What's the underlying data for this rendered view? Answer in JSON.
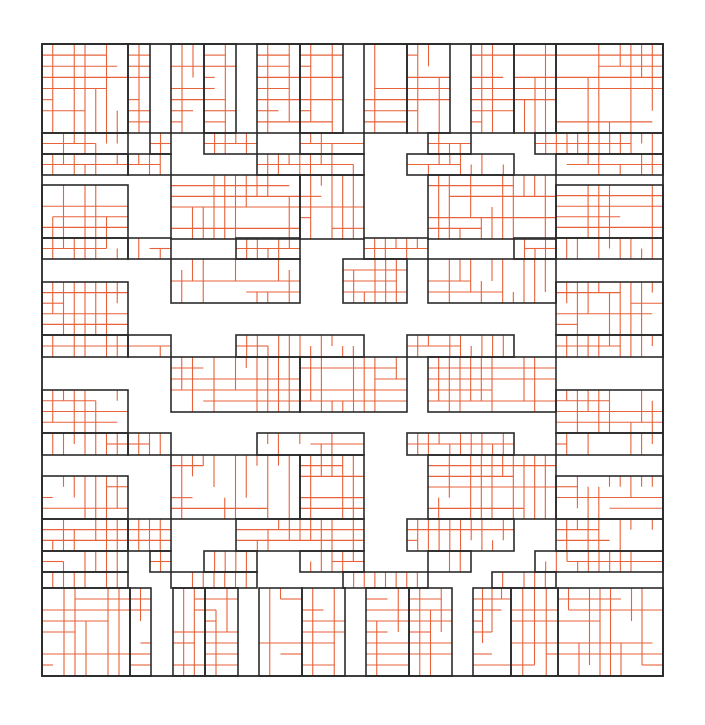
{
  "diagram": {
    "title": "",
    "colors": {
      "black_line": "#2b2b2b",
      "orange_line": "#e8623a",
      "background": "#ffffff"
    },
    "outer_square": {
      "x": 42,
      "y": 44,
      "w": 621,
      "h": 632
    },
    "band_cols": [
      42,
      128,
      150,
      171,
      182,
      204,
      236,
      257,
      300,
      343,
      364,
      407,
      428,
      450,
      471,
      492,
      514,
      535,
      556,
      663
    ],
    "band_rows": [
      44,
      133,
      154,
      175,
      185,
      206,
      238,
      259,
      282,
      303,
      335,
      357,
      390,
      412,
      433,
      455,
      476,
      497,
      519,
      551,
      572,
      588,
      676
    ],
    "rooms": [
      [
        42,
        44,
        86,
        89
      ],
      [
        128,
        44,
        22,
        89
      ],
      [
        171,
        44,
        33,
        89
      ],
      [
        204,
        44,
        32,
        89
      ],
      [
        257,
        44,
        43,
        89
      ],
      [
        300,
        44,
        43,
        89
      ],
      [
        364,
        44,
        43,
        89
      ],
      [
        407,
        44,
        43,
        89
      ],
      [
        471,
        44,
        43,
        89
      ],
      [
        514,
        44,
        42,
        89
      ],
      [
        556,
        44,
        107,
        89
      ],
      [
        42,
        133,
        86,
        21
      ],
      [
        150,
        133,
        21,
        21
      ],
      [
        204,
        133,
        53,
        21
      ],
      [
        300,
        133,
        64,
        21
      ],
      [
        428,
        133,
        43,
        21
      ],
      [
        535,
        133,
        128,
        21
      ],
      [
        42,
        154,
        86,
        21
      ],
      [
        128,
        154,
        43,
        21
      ],
      [
        257,
        154,
        107,
        21
      ],
      [
        407,
        154,
        107,
        21
      ],
      [
        556,
        154,
        107,
        21
      ],
      [
        171,
        175,
        129,
        64
      ],
      [
        300,
        175,
        64,
        64
      ],
      [
        428,
        175,
        128,
        64
      ],
      [
        42,
        185,
        86,
        53
      ],
      [
        556,
        185,
        107,
        53
      ],
      [
        42,
        238,
        86,
        21
      ],
      [
        128,
        238,
        43,
        21
      ],
      [
        236,
        238,
        64,
        21
      ],
      [
        364,
        238,
        64,
        21
      ],
      [
        514,
        238,
        42,
        21
      ],
      [
        556,
        238,
        107,
        21
      ],
      [
        171,
        259,
        129,
        44
      ],
      [
        343,
        259,
        64,
        44
      ],
      [
        428,
        259,
        128,
        44
      ],
      [
        42,
        282,
        86,
        53
      ],
      [
        556,
        282,
        107,
        53
      ],
      [
        42,
        335,
        86,
        22
      ],
      [
        128,
        335,
        43,
        22
      ],
      [
        236,
        335,
        128,
        22
      ],
      [
        407,
        335,
        107,
        22
      ],
      [
        556,
        335,
        107,
        22
      ],
      [
        171,
        357,
        129,
        55
      ],
      [
        300,
        357,
        107,
        55
      ],
      [
        428,
        357,
        128,
        55
      ],
      [
        42,
        390,
        86,
        43
      ],
      [
        556,
        390,
        107,
        43
      ],
      [
        42,
        433,
        86,
        22
      ],
      [
        128,
        433,
        43,
        22
      ],
      [
        257,
        433,
        107,
        22
      ],
      [
        407,
        433,
        107,
        22
      ],
      [
        556,
        433,
        107,
        22
      ],
      [
        171,
        455,
        129,
        64
      ],
      [
        300,
        455,
        64,
        64
      ],
      [
        428,
        455,
        128,
        64
      ],
      [
        42,
        476,
        86,
        43
      ],
      [
        556,
        476,
        107,
        43
      ],
      [
        42,
        519,
        86,
        32
      ],
      [
        128,
        519,
        43,
        32
      ],
      [
        236,
        519,
        128,
        32
      ],
      [
        407,
        519,
        107,
        32
      ],
      [
        556,
        519,
        107,
        32
      ],
      [
        42,
        551,
        86,
        21
      ],
      [
        150,
        551,
        21,
        21
      ],
      [
        204,
        551,
        53,
        21
      ],
      [
        300,
        551,
        64,
        21
      ],
      [
        428,
        551,
        43,
        21
      ],
      [
        535,
        551,
        128,
        21
      ],
      [
        42,
        572,
        86,
        16
      ],
      [
        171,
        572,
        86,
        16
      ],
      [
        343,
        572,
        85,
        16
      ],
      [
        492,
        572,
        64,
        16
      ],
      [
        42,
        588,
        88,
        88
      ],
      [
        130,
        588,
        21,
        88
      ],
      [
        173,
        588,
        32,
        88
      ],
      [
        205,
        588,
        33,
        88
      ],
      [
        259,
        588,
        43,
        88
      ],
      [
        302,
        588,
        43,
        88
      ],
      [
        366,
        588,
        43,
        88
      ],
      [
        409,
        588,
        43,
        88
      ],
      [
        473,
        588,
        38,
        88
      ],
      [
        511,
        588,
        47,
        88
      ],
      [
        558,
        588,
        105,
        88
      ]
    ],
    "orange_step": 10.8,
    "orange_seed": 7
  }
}
